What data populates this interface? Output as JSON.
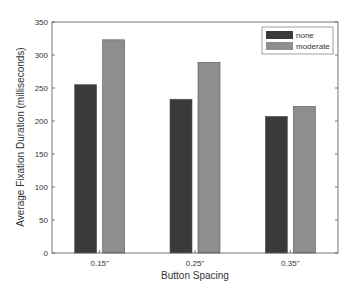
{
  "chart_data": {
    "type": "bar",
    "title": "",
    "xlabel": "Button Spacing",
    "ylabel": "Average Fixation Duration (milliseconds)",
    "categories": [
      "0.15\"",
      "0.25\"",
      "0.35\""
    ],
    "series": [
      {
        "name": "none",
        "color": "#3a3a3a",
        "values": [
          255,
          233,
          207
        ]
      },
      {
        "name": "moderate",
        "color": "#8e8e8e",
        "values": [
          323,
          289,
          222
        ]
      }
    ],
    "ylim": [
      0,
      350
    ],
    "yticks": [
      0,
      50,
      100,
      150,
      200,
      250,
      300,
      350
    ],
    "grid": false,
    "legend_position": "upper right"
  }
}
